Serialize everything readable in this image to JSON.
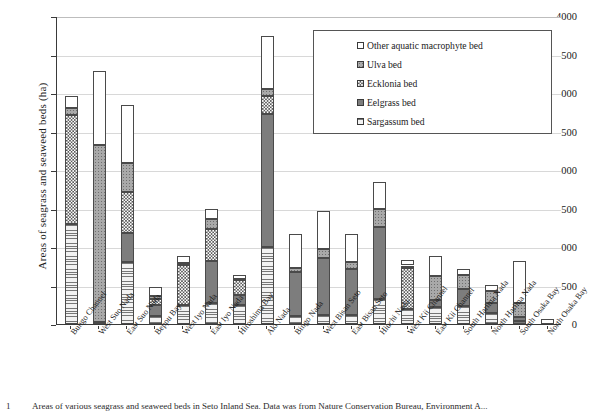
{
  "chart_data": {
    "type": "bar",
    "stacked": true,
    "title": "",
    "xlabel": "",
    "ylabel": "Areas of seagrass and seaweed beds (ha)",
    "ylim": [
      0,
      4000
    ],
    "ytick_step": 500,
    "yticks": [
      "0",
      "500",
      "1000",
      "1500",
      "2000",
      "2500",
      "3000",
      "3500",
      "4000"
    ],
    "grid": true,
    "legend_position": "top-right",
    "legend_order_top_to_bottom": [
      "Other aquatic macrophyte bed",
      "Ulva bed",
      "Ecklonia bed",
      "Eelgrass bed",
      "Sargassum bed"
    ],
    "categories": [
      "Bungo Channel",
      "West Suo Nada",
      "East Suo Nada",
      "Beppu Bay",
      "West Iyo Nada",
      "East Iyo Nada",
      "Hiroshima Bay",
      "Aki Nada",
      "Bingo Nada",
      "West Bisan Seto",
      "East Bisan Seto",
      "Hiuchi Nada",
      "West Kii Channel",
      "East Kii Channel",
      "South Harima Nada",
      "North Harima Nada",
      "South Osaka Bay",
      "North Osaka Bay"
    ],
    "series": [
      {
        "name": "Sargassum bed",
        "pattern": "horizontal-lines",
        "color": "#e6e6e6",
        "values": [
          1300,
          0,
          800,
          110,
          250,
          270,
          250,
          1000,
          110,
          120,
          120,
          330,
          200,
          220,
          230,
          140,
          40,
          0
        ]
      },
      {
        "name": "Eelgrass bed",
        "pattern": "solid-dark-gray",
        "color": "#7d7d7d",
        "values": [
          0,
          30,
          380,
          140,
          0,
          550,
          130,
          1730,
          560,
          740,
          600,
          930,
          0,
          90,
          230,
          130,
          50,
          0
        ]
      },
      {
        "name": "Ecklonia bed",
        "pattern": "checkerboard",
        "color": "#ffffff",
        "values": [
          1420,
          0,
          540,
          70,
          520,
          420,
          190,
          230,
          0,
          0,
          0,
          0,
          530,
          0,
          0,
          0,
          0,
          0
        ]
      },
      {
        "name": "Ulva bed",
        "pattern": "dotted-gray",
        "color": "#a9a9a9",
        "values": [
          90,
          2290,
          370,
          50,
          20,
          120,
          20,
          90,
          60,
          120,
          80,
          230,
          30,
          310,
          180,
          160,
          180,
          0
        ]
      },
      {
        "name": "Other aquatic macrophyte bed",
        "pattern": "open-white",
        "color": "#ffffff",
        "values": [
          150,
          970,
          760,
          110,
          90,
          140,
          50,
          690,
          440,
          490,
          370,
          350,
          70,
          260,
          80,
          80,
          550,
          70
        ]
      }
    ],
    "totals": [
      2960,
      3290,
      2850,
      480,
      880,
      1500,
      640,
      3740,
      1170,
      1470,
      1170,
      1840,
      830,
      880,
      720,
      510,
      820,
      70
    ]
  },
  "legend": {
    "items": [
      {
        "label": "Other aquatic macrophyte bed",
        "pattern": "open-white"
      },
      {
        "label": "Ulva bed",
        "pattern": "dotted-gray"
      },
      {
        "label": "Ecklonia bed",
        "pattern": "checkerboard"
      },
      {
        "label": "Eelgrass bed",
        "pattern": "solid-dark-gray"
      },
      {
        "label": "Sargassum bed",
        "pattern": "horizontal-lines"
      }
    ]
  },
  "caption": {
    "number": "1",
    "text": "Areas of various seagrass and seaweed beds in Seto Inland Sea. Data was from Nature Conservation Bureau, Environment A..."
  }
}
